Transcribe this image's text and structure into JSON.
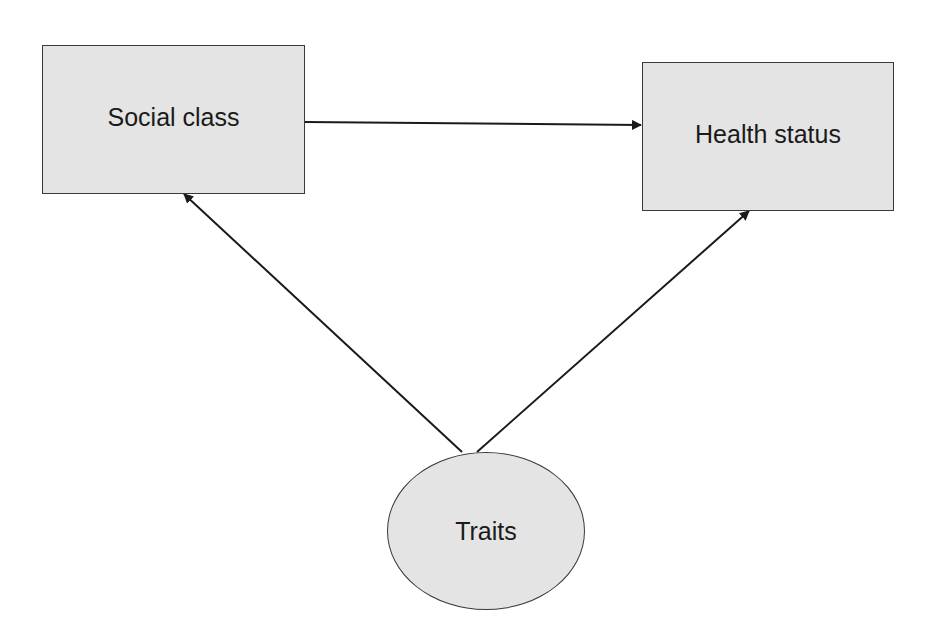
{
  "diagram": {
    "type": "causal-diagram",
    "nodes": [
      {
        "id": "social_class",
        "label": "Social class",
        "shape": "rectangle"
      },
      {
        "id": "health_status",
        "label": "Health status",
        "shape": "rectangle"
      },
      {
        "id": "traits",
        "label": "Traits",
        "shape": "ellipse"
      }
    ],
    "edges": [
      {
        "from": "social_class",
        "to": "health_status"
      },
      {
        "from": "traits",
        "to": "social_class"
      },
      {
        "from": "traits",
        "to": "health_status"
      }
    ],
    "colors": {
      "node_fill": "#e4e4e4",
      "node_border": "#3a3a3a",
      "edge": "#1a1a1a",
      "background": "#ffffff"
    }
  }
}
